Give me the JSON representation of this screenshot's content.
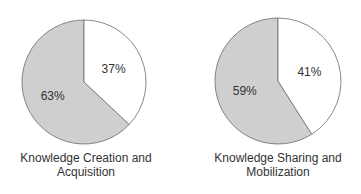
{
  "chart_data": [
    {
      "type": "pie",
      "title": "Knowledge Creation and Acquisition",
      "categories": [
        "Shaded",
        "Unshaded"
      ],
      "values": [
        63,
        37
      ],
      "labels": [
        "63%",
        "37%"
      ],
      "colors": [
        "#cfcfcf",
        "#ffffff"
      ]
    },
    {
      "type": "pie",
      "title": "Knowledge Sharing and Mobilization",
      "categories": [
        "Shaded",
        "Unshaded"
      ],
      "values": [
        59,
        41
      ],
      "labels": [
        "59%",
        "41%"
      ],
      "colors": [
        "#cfcfcf",
        "#ffffff"
      ]
    }
  ],
  "captions": {
    "left": {
      "line1": "Knowledge Creation and",
      "line2": "Acquisition"
    },
    "right": {
      "line1": "Knowledge Sharing and",
      "line2": "Mobilization"
    }
  }
}
